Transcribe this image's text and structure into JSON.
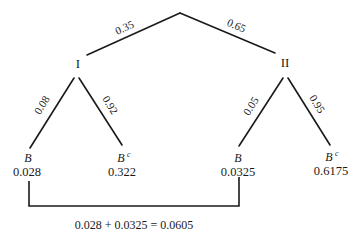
{
  "diagram": {
    "type": "probability-tree",
    "root": {
      "branches": [
        {
          "probability": "0.35",
          "node_label": "I"
        },
        {
          "probability": "0.65",
          "node_label": "II"
        }
      ]
    },
    "nodes": {
      "I": {
        "label": "I",
        "branches": [
          {
            "probability": "0.08",
            "event": "B",
            "superscript": "",
            "joint": "0.028"
          },
          {
            "probability": "0.92",
            "event": "B",
            "superscript": "c",
            "joint": "0.322"
          }
        ]
      },
      "II": {
        "label": "II",
        "branches": [
          {
            "probability": "0.05",
            "event": "B",
            "superscript": "",
            "joint": "0.0325"
          },
          {
            "probability": "0.95",
            "event": "B",
            "superscript": "c",
            "joint": "0.6175"
          }
        ]
      }
    },
    "bracket": {
      "connects": [
        "0.028",
        "0.0325"
      ],
      "equation": "0.028 + 0.0325 = 0.0605"
    }
  }
}
